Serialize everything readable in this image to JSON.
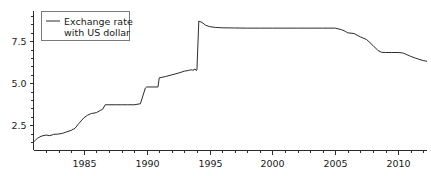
{
  "chart_data": {
    "type": "line",
    "title": "",
    "xlabel": "",
    "ylabel": "",
    "xlim": [
      1981.0,
      2012.3
    ],
    "ylim": [
      1.0,
      9.3
    ],
    "grid": false,
    "legend_position": "top-left",
    "xticks": [
      1985,
      1990,
      1995,
      2000,
      2005,
      2010
    ],
    "xtick_labels": [
      "1985",
      "1990",
      "1995",
      "2000",
      "2005",
      "2010"
    ],
    "xminor_ticks": [
      1982,
      1983,
      1984,
      1986,
      1987,
      1988,
      1989,
      1991,
      1992,
      1993,
      1994,
      1996,
      1997,
      1998,
      1999,
      2001,
      2002,
      2003,
      2004,
      2006,
      2007,
      2008,
      2009,
      2011,
      2012
    ],
    "yticks": [
      2.5,
      5.0,
      7.5
    ],
    "ytick_labels": [
      "2.5",
      "5.0",
      "7.5"
    ],
    "yminor_ticks": [
      1.5,
      2.0,
      3.0,
      3.5,
      4.0,
      4.5,
      5.5,
      6.0,
      6.5,
      7.0,
      8.0,
      8.5,
      9.0
    ],
    "series": [
      {
        "name": "Exchange rate with US dollar",
        "color": "#2b2b2b",
        "x": [
          1981.0,
          1981.3,
          1981.6,
          1982.0,
          1982.3,
          1982.6,
          1983.0,
          1983.3,
          1983.6,
          1984.0,
          1984.3,
          1984.6,
          1985.0,
          1985.3,
          1985.6,
          1986.0,
          1986.3,
          1986.5,
          1986.7,
          1987.0,
          1987.5,
          1988.0,
          1988.5,
          1989.0,
          1989.5,
          1989.9,
          1990.0,
          1990.5,
          1990.9,
          1991.0,
          1991.5,
          1992.0,
          1992.5,
          1993.0,
          1993.3,
          1993.5,
          1993.7,
          1993.85,
          1993.95,
          1994.0,
          1994.15,
          1994.4,
          1994.7,
          1995.0,
          1995.5,
          1996.0,
          1997.0,
          1998.0,
          1999.0,
          2000.0,
          2001.0,
          2002.0,
          2003.0,
          2004.0,
          2005.0,
          2005.5,
          2005.8,
          2006.0,
          2006.5,
          2007.0,
          2007.5,
          2008.0,
          2008.4,
          2008.7,
          2009.0,
          2009.5,
          2010.0,
          2010.4,
          2010.7,
          2011.0,
          2011.3,
          2011.6,
          2012.0,
          2012.3
        ],
        "y": [
          1.5,
          1.72,
          1.85,
          1.92,
          1.88,
          1.96,
          1.98,
          2.02,
          2.1,
          2.2,
          2.32,
          2.6,
          2.94,
          3.1,
          3.2,
          3.25,
          3.38,
          3.45,
          3.72,
          3.72,
          3.72,
          3.72,
          3.72,
          3.72,
          3.78,
          4.72,
          4.78,
          4.78,
          4.78,
          5.32,
          5.4,
          5.5,
          5.6,
          5.72,
          5.76,
          5.8,
          5.78,
          5.85,
          5.75,
          5.8,
          8.7,
          8.62,
          8.45,
          8.37,
          8.32,
          8.3,
          8.29,
          8.28,
          8.28,
          8.28,
          8.28,
          8.28,
          8.28,
          8.28,
          8.28,
          8.19,
          8.09,
          8.0,
          7.96,
          7.76,
          7.6,
          7.25,
          6.95,
          6.84,
          6.83,
          6.83,
          6.83,
          6.8,
          6.7,
          6.6,
          6.52,
          6.44,
          6.35,
          6.31
        ]
      }
    ],
    "legend": [
      {
        "label_line1": "Exchange rate",
        "label_line2": "with US dollar",
        "color": "#2b2b2b"
      }
    ]
  },
  "axis": {
    "color": "#2b2b2b"
  }
}
